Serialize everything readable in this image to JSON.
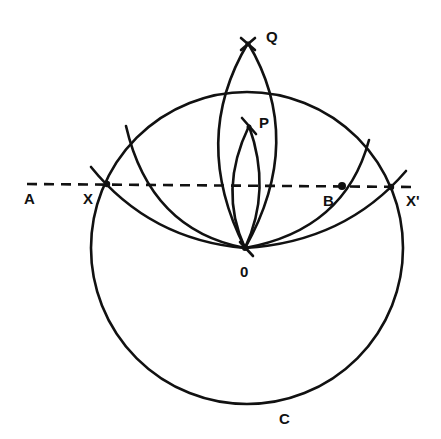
{
  "diagram": {
    "type": "geometric-construction",
    "line": {
      "name": "A",
      "style": "dashed"
    },
    "labels": {
      "A": "A",
      "X": "X",
      "X_prime": "X'",
      "B": "B",
      "O": "0",
      "P": "P",
      "Q": "Q",
      "C": "C"
    },
    "colors": {
      "ink": "#111111",
      "background": "#ffffff"
    }
  }
}
